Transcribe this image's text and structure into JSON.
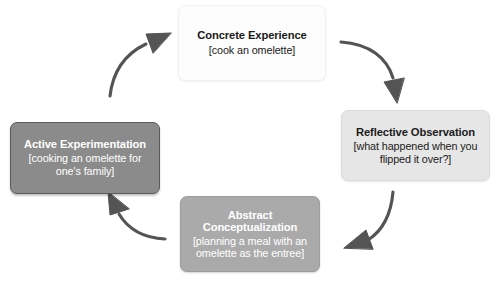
{
  "diagram": {
    "background_color": "#ffffff",
    "arrow_color": "#545454",
    "nodes": [
      {
        "id": "concrete-experience",
        "title": "Concrete Experience",
        "detail": "[cook an omelette]",
        "fill_color": "#fdfdfd",
        "text_color": "#1a1a1a"
      },
      {
        "id": "reflective-observation",
        "title": "Reflective Observation",
        "detail": "[what happened when you flipped it over?]",
        "fill_color": "#e6e6e6",
        "text_color": "#1a1a1a"
      },
      {
        "id": "abstract-conceptualization",
        "title": "Abstract Conceptualization",
        "detail": "[planning a meal with an omelette as the entree]",
        "fill_color": "#aaaaaa",
        "text_color": "#ffffff"
      },
      {
        "id": "active-experimentation",
        "title": "Active Experimentation",
        "detail": "[cooking an omelette for one's family]",
        "fill_color": "#8b8b8b",
        "text_color": "#ffffff"
      }
    ],
    "arrows": [
      {
        "id": "arrow-concrete-to-reflective",
        "from": "concrete-experience",
        "to": "reflective-observation",
        "direction": "clockwise"
      },
      {
        "id": "arrow-reflective-to-abstract",
        "from": "reflective-observation",
        "to": "abstract-conceptualization",
        "direction": "clockwise"
      },
      {
        "id": "arrow-abstract-to-active",
        "from": "abstract-conceptualization",
        "to": "active-experimentation",
        "direction": "clockwise"
      },
      {
        "id": "arrow-active-to-concrete",
        "from": "active-experimentation",
        "to": "concrete-experience",
        "direction": "clockwise"
      }
    ]
  }
}
